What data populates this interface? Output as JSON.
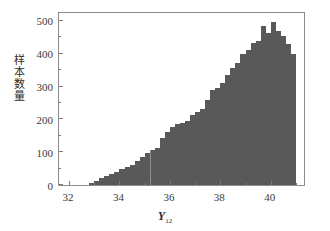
{
  "chart_data": {
    "type": "bar",
    "title": "",
    "subtitle": "",
    "xlabel": "Y",
    "xlabel_subscript": "12",
    "ylabel": "样本数量",
    "ylabel_chars": [
      "样",
      "本",
      "数",
      "量"
    ],
    "xlim": [
      31.6,
      41.4
    ],
    "ylim": [
      0,
      530
    ],
    "xticks": [
      32,
      34,
      36,
      38,
      40
    ],
    "xtick_labels": [
      "32",
      "34",
      "36",
      "38",
      "40"
    ],
    "xticks_minor": [
      33,
      35,
      37,
      39,
      41
    ],
    "yticks": [
      0,
      100,
      200,
      300,
      400,
      500
    ],
    "ytick_labels": [
      "0",
      "100",
      "200",
      "300",
      "400",
      "500"
    ],
    "yticks_minor": [
      50,
      150,
      250,
      350,
      450
    ],
    "grid": false,
    "legend": false,
    "bar_color": "#595959",
    "axis_color": "#8c8c8c",
    "bin_width": 0.2,
    "categories": [
      "32.8",
      "33.0",
      "33.2",
      "33.4",
      "33.6",
      "33.8",
      "34.0",
      "34.2",
      "34.4",
      "34.6",
      "34.8",
      "35.0",
      "35.2",
      "35.4",
      "35.6",
      "35.8",
      "36.0",
      "36.2",
      "36.4",
      "36.6",
      "36.8",
      "37.0",
      "37.2",
      "37.4",
      "37.6",
      "37.8",
      "38.0",
      "38.2",
      "38.4",
      "38.6",
      "38.8",
      "39.0",
      "39.2",
      "39.4",
      "39.6",
      "39.8",
      "40.0",
      "40.2",
      "40.4",
      "40.6",
      "40.8"
    ],
    "values": [
      6,
      12,
      20,
      27,
      33,
      40,
      48,
      55,
      62,
      72,
      85,
      96,
      108,
      113,
      142,
      160,
      178,
      186,
      190,
      196,
      213,
      222,
      232,
      258,
      290,
      296,
      310,
      335,
      355,
      372,
      398,
      412,
      432,
      440,
      485,
      462,
      496,
      468,
      455,
      430,
      400
    ],
    "peak_value": 500,
    "peak_x": "39.4"
  }
}
